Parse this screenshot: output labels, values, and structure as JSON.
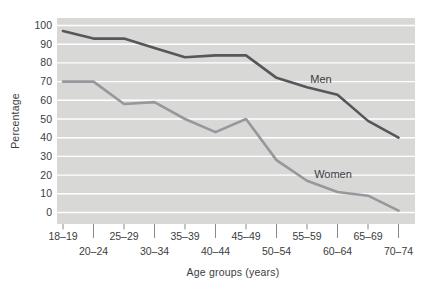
{
  "chart_data": {
    "type": "line",
    "title": "",
    "xlabel": "Age groups (years)",
    "ylabel": "Percentage",
    "categories": [
      "18–19",
      "20–24",
      "25–29",
      "30–34",
      "35–39",
      "40–44",
      "45–49",
      "50–54",
      "55–59",
      "60–64",
      "65–69",
      "70–74"
    ],
    "series": [
      {
        "name": "Men",
        "color": "#55575a",
        "values": [
          97,
          93,
          93,
          88,
          83,
          84,
          84,
          72,
          67,
          63,
          49,
          40
        ],
        "label_pos": {
          "x": 321,
          "y": 83
        }
      },
      {
        "name": "Women",
        "color": "#96989b",
        "values": [
          70,
          70,
          58,
          59,
          50,
          43,
          50,
          28,
          17,
          11,
          9,
          1
        ],
        "label_pos": {
          "x": 333,
          "y": 178
        }
      }
    ],
    "ylim": [
      0,
      100
    ],
    "yticks": [
      0,
      10,
      20,
      30,
      40,
      50,
      60,
      70,
      80,
      90,
      100
    ],
    "grid": "horizontal",
    "legend": "inline-labels",
    "plot_bg": "#d8d8d7",
    "gridline_color": "#ffffff",
    "tick_color": "#87898b",
    "text_color": "#3b3c3e"
  }
}
